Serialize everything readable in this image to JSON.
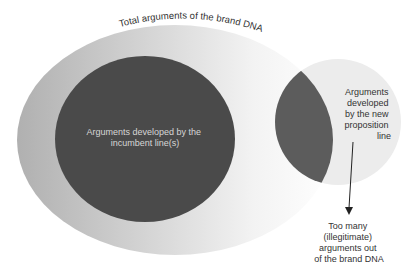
{
  "diagram": {
    "outer_set": {
      "label": "Total arguments of the brand DNA",
      "fill_left": "#b5b5b5",
      "fill_right": "#ffffff"
    },
    "incumbent_set": {
      "label_lines": [
        "Arguments developed by the",
        "incumbent line(s)"
      ],
      "fill": "#4a4a4a",
      "text_color": "#d6d6d6"
    },
    "new_proposition_set": {
      "label_lines": [
        "Arguments",
        "developed",
        "by the new",
        "proposition",
        "line"
      ],
      "fill": "#ececec",
      "overlap_fill": "#5c5c5c"
    },
    "callout": {
      "label_lines": [
        "Too many",
        "(illegitimate)",
        "arguments out",
        "of the brand DNA"
      ],
      "arrow": "down-arrow"
    },
    "text_color": "#333333"
  }
}
